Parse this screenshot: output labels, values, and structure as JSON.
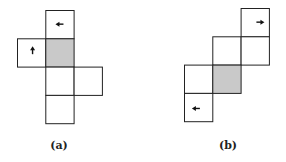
{
  "figures": [
    {
      "id": "a",
      "label": "(a)",
      "cells": [
        {
          "row": 0,
          "col": 1,
          "shaded": false,
          "arrow": "left"
        },
        {
          "row": 1,
          "col": 0,
          "shaded": false,
          "arrow": "up"
        },
        {
          "row": 1,
          "col": 1,
          "shaded": true,
          "arrow": null
        },
        {
          "row": 2,
          "col": 1,
          "shaded": false,
          "arrow": null
        },
        {
          "row": 2,
          "col": 2,
          "shaded": false,
          "arrow": null
        },
        {
          "row": 3,
          "col": 1,
          "shaded": false,
          "arrow": null
        }
      ]
    },
    {
      "id": "b",
      "label": "(b)",
      "cells": [
        {
          "row": 0,
          "col": 2,
          "shaded": false,
          "arrow": "right"
        },
        {
          "row": 1,
          "col": 1,
          "shaded": false,
          "arrow": null
        },
        {
          "row": 1,
          "col": 2,
          "shaded": false,
          "arrow": null
        },
        {
          "row": 2,
          "col": 0,
          "shaded": false,
          "arrow": null
        },
        {
          "row": 2,
          "col": 1,
          "shaded": true,
          "arrow": null
        },
        {
          "row": 3,
          "col": 0,
          "shaded": false,
          "arrow": "left"
        }
      ]
    }
  ],
  "colors": {
    "shaded": "#c9c9c9",
    "stroke": "#222222"
  }
}
